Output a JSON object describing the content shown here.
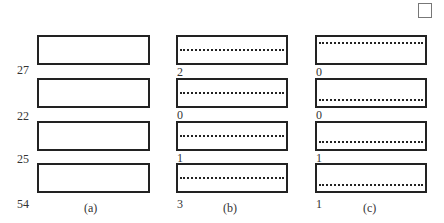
{
  "diagram": {
    "corner_box": {
      "label": ""
    },
    "columns": [
      {
        "caption": "(a)",
        "labels": [
          "27",
          "22",
          "25",
          "54"
        ],
        "rows": [
          {
            "dashed": false
          },
          {
            "dashed": false
          },
          {
            "dashed": false
          },
          {
            "dashed": false
          }
        ]
      },
      {
        "caption": "(b)",
        "labels": [
          "2",
          "0",
          "1",
          "3"
        ],
        "rows": [
          {
            "dashed": true,
            "position": "middle"
          },
          {
            "dashed": true,
            "position": "middle"
          },
          {
            "dashed": true,
            "position": "middle"
          },
          {
            "dashed": true,
            "position": "middle"
          }
        ]
      },
      {
        "caption": "(c)",
        "labels": [
          "0",
          "0",
          "1",
          "1"
        ],
        "rows": [
          {
            "dashed": true,
            "position": "top"
          },
          {
            "dashed": true,
            "position": "bottom"
          },
          {
            "dashed": true,
            "position": "bottom"
          },
          {
            "dashed": true,
            "position": "bottom"
          }
        ]
      }
    ]
  }
}
